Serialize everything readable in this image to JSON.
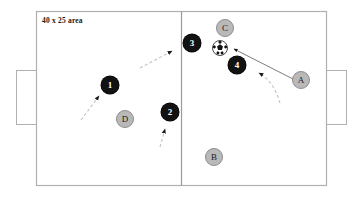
{
  "diagram": {
    "title_label": "40 x 25 area",
    "colors": {
      "pitch_line": "#b0b0b0",
      "halfway_line": "#9a9a9a",
      "attacking_token_fill": "#121212",
      "attacking_token_text": "#ffffff",
      "defending_token_fill": "#b9b9b9",
      "defending_token_text": "#1a1a1a",
      "defending_token_stroke": "#8d8d8d",
      "solid_run_line": "#6e6e6e",
      "dashed_run_line": "#bdbdbd",
      "arrowhead": "#1a1a1a",
      "background": "#ffffff"
    },
    "pitch": {
      "left": 36,
      "top": 11,
      "width": 291,
      "height": 175,
      "halfway_x": 181,
      "goals": [
        {
          "name": "left-goal",
          "x": 16,
          "y": 70,
          "width": 20,
          "height": 54
        },
        {
          "name": "right-goal",
          "x": 327,
          "y": 70,
          "width": 20,
          "height": 54
        }
      ]
    },
    "ball": {
      "label": "soccer-ball",
      "cx": 220,
      "cy": 48,
      "r": 8
    },
    "players": [
      {
        "id": "1",
        "label": "1",
        "team": "attacking",
        "cx": 110,
        "cy": 85,
        "r": 9
      },
      {
        "id": "2",
        "label": "2",
        "team": "attacking",
        "cx": 170,
        "cy": 112,
        "r": 9
      },
      {
        "id": "3",
        "label": "3",
        "team": "attacking",
        "cx": 192,
        "cy": 43,
        "r": 9
      },
      {
        "id": "4",
        "label": "4",
        "team": "attacking",
        "cx": 237,
        "cy": 65,
        "r": 9
      },
      {
        "id": "A",
        "label": "A",
        "team": "defending",
        "cx": 301,
        "cy": 80,
        "r": 9
      },
      {
        "id": "B",
        "label": "B",
        "team": "defending",
        "cx": 214,
        "cy": 157,
        "r": 9
      },
      {
        "id": "C",
        "label": "C",
        "team": "defending",
        "cx": 225,
        "cy": 28,
        "r": 9
      },
      {
        "id": "D",
        "label": "D",
        "team": "defending",
        "cx": 125,
        "cy": 119,
        "r": 9
      }
    ],
    "movement_paths": [
      {
        "name": "run-toward-player-1",
        "style": "dashed",
        "points": "81,120 97,98",
        "arrow_at": "97,98",
        "arrow_angle": -54
      },
      {
        "name": "run-toward-upper-right",
        "style": "dashed",
        "points": "142,67 172,52",
        "arrow_at": "172,52",
        "arrow_angle": -27
      },
      {
        "name": "run-toward-player-2",
        "style": "dashed",
        "points": "161,146 165,130",
        "arrow_at": "165,130",
        "arrow_angle": -76
      },
      {
        "name": "pass-from-a-to-ball",
        "style": "solid",
        "points": "292,80 232,49",
        "arrow_at": "232,49",
        "arrow_angle": 207
      },
      {
        "name": "run-of-player-a",
        "style": "dashed-curve",
        "points": "M 278,100 C 274,88 268,78 258,73",
        "arrow_at": "258,73",
        "arrow_angle": 206
      }
    ]
  }
}
